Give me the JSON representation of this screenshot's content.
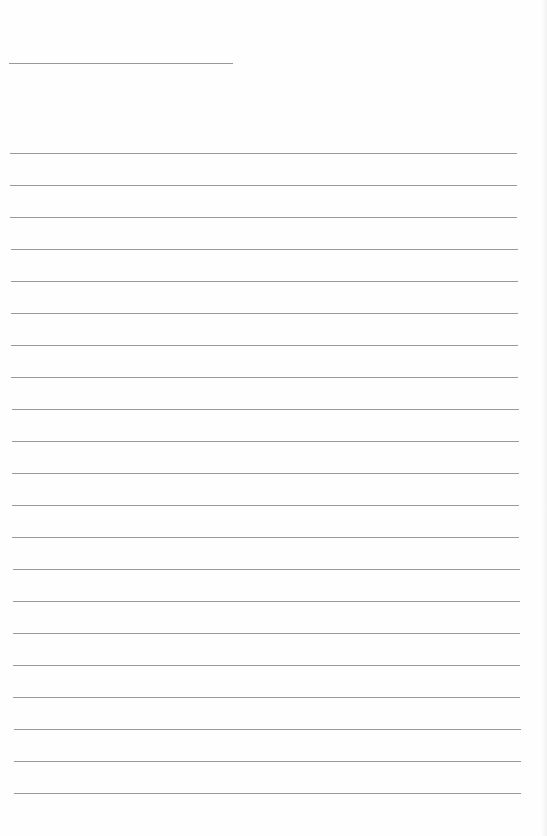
{
  "document": {
    "type": "blank lined paper",
    "background_color": "#fefefe",
    "line_color": "#9a9a9a",
    "title_line": {
      "x": 9,
      "y": 63,
      "width": 224
    },
    "ruled_lines": {
      "count": 21,
      "x_start": 10,
      "x_end": 517,
      "first_y": 153,
      "spacing": 32
    }
  }
}
